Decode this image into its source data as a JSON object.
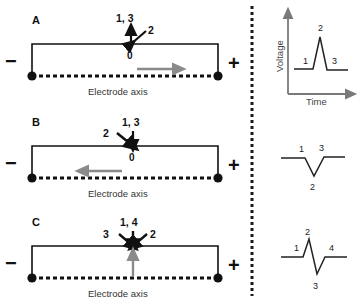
{
  "figure": {
    "colors": {
      "ink": "#111111",
      "gray_arrow": "#8a8a8a",
      "axis_gray": "#7a7a7a",
      "divider": "#1a1a1a",
      "background": "#ffffff"
    },
    "divider": {
      "name": "dotted-vertical-divider",
      "style": "dashed"
    }
  },
  "panels": [
    {
      "letter": "A",
      "electrode": {
        "negative_label": "−",
        "positive_label": "+",
        "axis_label": "Electrode axis",
        "origin_label": "0",
        "flow_arrow_direction": "right"
      },
      "vectors": [
        {
          "label": "1, 3",
          "direction": "up"
        },
        {
          "label": "2",
          "direction": "down-right"
        }
      ],
      "waveform": {
        "shape": "positive-spike",
        "points": [
          "1",
          "2",
          "3"
        ],
        "labels": {
          "baseline_start": "1",
          "peak": "2",
          "baseline_end": "3"
        }
      }
    },
    {
      "letter": "B",
      "electrode": {
        "negative_label": "−",
        "positive_label": "+",
        "axis_label": "Electrode axis",
        "origin_label": "0",
        "flow_arrow_direction": "left"
      },
      "vectors": [
        {
          "label": "1, 3",
          "direction": "down"
        },
        {
          "label": "2",
          "direction": "down-right"
        }
      ],
      "waveform": {
        "shape": "negative-deflection",
        "points": [
          "1",
          "2",
          "3"
        ],
        "labels": {
          "baseline_start": "1",
          "trough": "2",
          "baseline_end": "3"
        }
      }
    },
    {
      "letter": "C",
      "electrode": {
        "negative_label": "−",
        "positive_label": "+",
        "axis_label": "Electrode axis",
        "origin_label": "",
        "flow_arrow_direction": "up"
      },
      "vectors": [
        {
          "label": "1, 4",
          "direction": "down"
        },
        {
          "label": "3",
          "direction": "down-right"
        },
        {
          "label": "2",
          "direction": "down-left"
        }
      ],
      "waveform": {
        "shape": "biphasic",
        "points": [
          "1",
          "2",
          "3",
          "4"
        ],
        "labels": {
          "baseline_start": "1",
          "peak": "2",
          "trough": "3",
          "baseline_end": "4"
        }
      }
    }
  ],
  "plot_axes": {
    "ylabel": "Voltage",
    "xlabel": "Time"
  }
}
